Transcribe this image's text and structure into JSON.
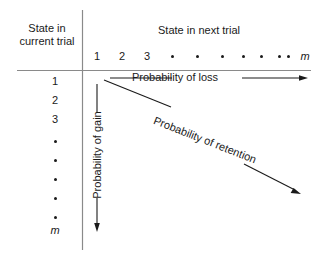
{
  "figure": {
    "row_axis_title": "State in current trial",
    "column_axis_title": "State in next trial",
    "column_ticks": [
      {
        "label": "1",
        "x": 97,
        "kind": "number"
      },
      {
        "label": "2",
        "x": 122,
        "kind": "number"
      },
      {
        "label": "3",
        "x": 147,
        "kind": "number"
      },
      {
        "label": "•",
        "x": 172,
        "kind": "dot"
      },
      {
        "label": "•",
        "x": 197,
        "kind": "dot"
      },
      {
        "label": "•",
        "x": 222,
        "kind": "dot"
      },
      {
        "label": "•",
        "x": 243,
        "kind": "dot"
      },
      {
        "label": "•",
        "x": 261,
        "kind": "dot"
      },
      {
        "label": "•",
        "x": 279,
        "kind": "dot"
      },
      {
        "label": "•",
        "x": 288,
        "kind": "dot"
      },
      {
        "label": "m",
        "x": 305,
        "kind": "italic"
      }
    ],
    "row_ticks": [
      {
        "label": "1",
        "y": 81,
        "kind": "number"
      },
      {
        "label": "2",
        "y": 100,
        "kind": "number"
      },
      {
        "label": "3",
        "y": 119,
        "kind": "number"
      },
      {
        "label": "•",
        "y": 140,
        "kind": "dot"
      },
      {
        "label": "•",
        "y": 159,
        "kind": "dot"
      },
      {
        "label": "•",
        "y": 178,
        "kind": "dot"
      },
      {
        "label": "•",
        "y": 197,
        "kind": "dot"
      },
      {
        "label": "•",
        "y": 216,
        "kind": "dot"
      },
      {
        "label": "m",
        "y": 230,
        "kind": "italic"
      }
    ],
    "annotations": {
      "loss": "Probability of loss",
      "gain": "Probability of gain",
      "retention": "Probability of retention"
    },
    "colors": {
      "background": "#ffffff",
      "ink": "#1a1a1a",
      "rule": "#8a8a8a"
    }
  }
}
